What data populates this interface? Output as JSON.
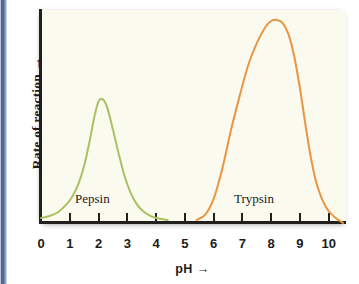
{
  "figure": {
    "name": "enzyme-activity-ph-curve",
    "background_color": "#ffffff",
    "plot_background_color": "#fbfaef",
    "axis_color": "#231f1c",
    "edge_band_color": "#4a5f8a"
  },
  "axes": {
    "y_label": "Rate of reaction  →",
    "x_label": "pH   →",
    "x_ticklabels": [
      "0",
      "1",
      "2",
      "3",
      "4",
      "5",
      "6",
      "7",
      "8",
      "9",
      "10"
    ]
  },
  "annotations": {
    "pepsin_label": "Pepsin",
    "trypsin_label": "Trypsin"
  },
  "chart_data": {
    "type": "line",
    "title": "",
    "subtitle": "",
    "xlabel": "pH  →",
    "ylabel": "Rate of reaction  →",
    "xlim": [
      0,
      10.6
    ],
    "ylim": [
      0,
      1.12
    ],
    "xticks": [
      0,
      1,
      2,
      3,
      4,
      5,
      6,
      7,
      8,
      9,
      10
    ],
    "xticklabels": [
      "0",
      "1",
      "2",
      "3",
      "4",
      "5",
      "6",
      "7",
      "8",
      "9",
      "10"
    ],
    "yticks": [],
    "yticklabels": [],
    "grid": false,
    "legend_position": "inline-annotations",
    "annotations": [
      {
        "text": "Pepsin",
        "x": 2.0,
        "y": 0.13
      },
      {
        "text": "Trypsin",
        "x": 7.5,
        "y": 0.13
      }
    ],
    "series": [
      {
        "name": "Pepsin",
        "color": "#a9c162",
        "peak_ph": 2.0,
        "peak_value": 0.6,
        "active_range": [
          0.0,
          4.3
        ],
        "x": [
          0.0,
          0.3,
          0.6,
          0.9,
          1.1,
          1.3,
          1.5,
          1.7,
          1.85,
          2.0,
          2.15,
          2.3,
          2.5,
          2.7,
          2.9,
          3.1,
          3.3,
          3.5,
          3.8,
          4.1,
          4.4
        ],
        "y": [
          0.015,
          0.025,
          0.045,
          0.085,
          0.125,
          0.185,
          0.275,
          0.405,
          0.515,
          0.595,
          0.605,
          0.565,
          0.455,
          0.335,
          0.225,
          0.145,
          0.09,
          0.055,
          0.026,
          0.012,
          0.005
        ]
      },
      {
        "name": "Trypsin",
        "color": "#e89642",
        "peak_ph": 8.2,
        "peak_value": 1.0,
        "active_range": [
          5.4,
          10.6
        ],
        "x": [
          5.4,
          5.7,
          6.0,
          6.3,
          6.6,
          6.9,
          7.2,
          7.5,
          7.8,
          8.0,
          8.2,
          8.4,
          8.6,
          8.8,
          9.0,
          9.2,
          9.4,
          9.6,
          9.9,
          10.2,
          10.5
        ],
        "y": [
          0.005,
          0.03,
          0.11,
          0.26,
          0.45,
          0.62,
          0.775,
          0.885,
          0.965,
          0.995,
          1.0,
          0.985,
          0.93,
          0.82,
          0.66,
          0.47,
          0.3,
          0.175,
          0.07,
          0.02,
          -0.01
        ]
      }
    ]
  }
}
